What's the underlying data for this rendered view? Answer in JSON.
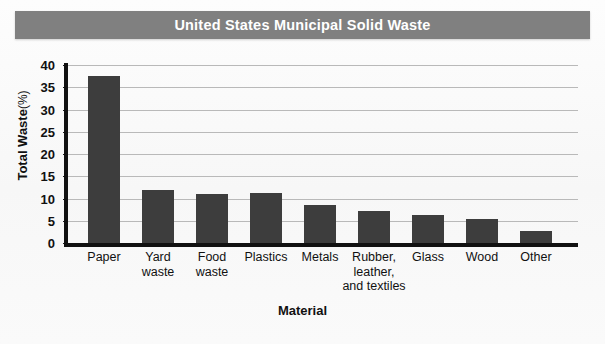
{
  "figure": {
    "title": "United States Municipal Solid Waste",
    "title_band_color": "#808080",
    "title_text_color": "#ffffff",
    "background_color": "#fbfbfb"
  },
  "axes": {
    "y_title_main": "Total Waste",
    "y_title_unit": "(%)",
    "x_title": "Material"
  },
  "chart_data": {
    "type": "bar",
    "title": "United States Municipal Solid Waste",
    "xlabel": "Material",
    "ylabel": "Total Waste (%)",
    "ylim": [
      0,
      40
    ],
    "ytick_step": 5,
    "yticks": [
      0,
      5,
      10,
      15,
      20,
      25,
      30,
      35,
      40
    ],
    "ytick_labels": [
      "0",
      "5",
      "10",
      "15",
      "20",
      "25",
      "30",
      "35",
      "40"
    ],
    "grid": true,
    "grid_axis": "y",
    "grid_color": "#b9b9b9",
    "legend": false,
    "bar_color": "#3d3d3d",
    "categories": [
      "Paper",
      "Yard waste",
      "Food waste",
      "Plastics",
      "Metals",
      "Rubber, leather, and textiles",
      "Glass",
      "Wood",
      "Other"
    ],
    "category_label_lines": [
      [
        "Paper"
      ],
      [
        "Yard",
        "waste"
      ],
      [
        "Food",
        "waste"
      ],
      [
        "Plastics"
      ],
      [
        "Metals"
      ],
      [
        "Rubber,",
        "leather,",
        "and textiles"
      ],
      [
        "Glass"
      ],
      [
        "Wood"
      ],
      [
        "Other"
      ]
    ],
    "values": [
      37.5,
      12.0,
      11.1,
      11.2,
      8.5,
      7.3,
      6.4,
      5.5,
      2.7
    ]
  }
}
